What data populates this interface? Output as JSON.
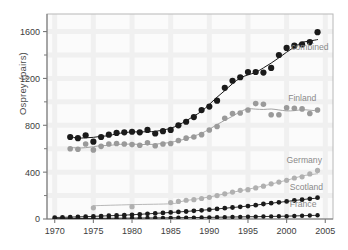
{
  "chart_data": {
    "type": "scatter",
    "title": "",
    "xlabel": "",
    "ylabel": "Osprey (pairs)",
    "xlim": [
      1969,
      2006
    ],
    "ylim": [
      0,
      1750
    ],
    "xticks": [
      1970,
      1975,
      1980,
      1985,
      1990,
      1995,
      2000,
      2005
    ],
    "xtick_labels": [
      "1970",
      "1975",
      "1980",
      "1985",
      "1990",
      "1995",
      "2000",
      "2005"
    ],
    "yticks": [
      0,
      400,
      800,
      1200,
      1600
    ],
    "ytick_labels": [
      "0",
      "400",
      "800",
      "1200",
      "1600"
    ],
    "yminorticks": [
      200,
      600,
      1000,
      1400
    ],
    "grid": "faint",
    "legend_position": "inline-right-of-curve",
    "series": [
      {
        "name": "combined",
        "label": "combined",
        "color": "#1a1a1a",
        "marker": "filled-circle",
        "marker_size": 3.1,
        "fit": "sigmoid-smooth",
        "label_x": 2000.6,
        "label_y": 1445,
        "x": [
          1972,
          1973,
          1974,
          1975,
          1976,
          1977,
          1978,
          1979,
          1980,
          1981,
          1982,
          1983,
          1984,
          1985,
          1986,
          1987,
          1988,
          1989,
          1990,
          1991,
          1992,
          1993,
          1994,
          1995,
          1996,
          1997,
          1998,
          1999,
          2000,
          2001,
          2002,
          2003,
          2004
        ],
        "y": [
          700,
          690,
          715,
          660,
          700,
          720,
          735,
          740,
          745,
          740,
          760,
          730,
          750,
          760,
          800,
          830,
          870,
          930,
          960,
          1010,
          1120,
          1180,
          1210,
          1255,
          1255,
          1250,
          1290,
          1400,
          1460,
          1480,
          1490,
          1510,
          1595
        ]
      },
      {
        "name": "finland",
        "label": "Finland",
        "color": "#9a9a9a",
        "marker": "filled-circle",
        "marker_size": 2.8,
        "fit": "hump-smooth",
        "label_x": 2000.2,
        "label_y": 1010,
        "x": [
          1972,
          1973,
          1974,
          1975,
          1976,
          1977,
          1978,
          1979,
          1980,
          1981,
          1982,
          1983,
          1984,
          1985,
          1986,
          1987,
          1988,
          1989,
          1990,
          1991,
          1992,
          1993,
          1994,
          1995,
          1996,
          1997,
          1998,
          1999,
          2000,
          2001,
          2002,
          2003,
          2004
        ],
        "y": [
          600,
          595,
          640,
          590,
          620,
          640,
          645,
          640,
          635,
          630,
          650,
          625,
          640,
          645,
          670,
          690,
          700,
          720,
          760,
          790,
          860,
          900,
          905,
          930,
          985,
          980,
          890,
          890,
          950,
          945,
          940,
          900,
          930
        ]
      },
      {
        "name": "germany",
        "label": "Germany",
        "color": "#b0b0b0",
        "marker": "filled-circle",
        "marker_size": 2.6,
        "fit": "exponential-smooth",
        "label_x": 2000.0,
        "label_y": 475,
        "x": [
          1975,
          1980,
          1985,
          1986,
          1987,
          1988,
          1989,
          1990,
          1991,
          1992,
          1993,
          1994,
          1995,
          1996,
          1997,
          1998,
          1999,
          2000,
          2001,
          2002,
          2003,
          2004
        ],
        "y": [
          95,
          105,
          140,
          150,
          160,
          165,
          175,
          185,
          200,
          215,
          230,
          245,
          250,
          265,
          280,
          300,
          315,
          330,
          350,
          360,
          385,
          415
        ]
      },
      {
        "name": "scotland",
        "label": "Scotland",
        "color": "#1a1a1a",
        "marker": "filled-circle",
        "marker_size": 2.4,
        "fit": "linear-smooth",
        "label_x": 2000.4,
        "label_y": 250,
        "x": [
          1970,
          1971,
          1972,
          1973,
          1974,
          1975,
          1976,
          1977,
          1978,
          1979,
          1980,
          1981,
          1982,
          1983,
          1984,
          1985,
          1986,
          1987,
          1988,
          1989,
          1990,
          1991,
          1992,
          1993,
          1994,
          1995,
          1996,
          1997,
          1998,
          1999,
          2000,
          2001,
          2002,
          2003,
          2004
        ],
        "y": [
          12,
          14,
          16,
          18,
          20,
          22,
          25,
          28,
          30,
          33,
          36,
          40,
          44,
          48,
          52,
          56,
          60,
          64,
          70,
          74,
          80,
          86,
          92,
          98,
          104,
          110,
          118,
          128,
          135,
          142,
          150,
          158,
          165,
          172,
          182
        ]
      },
      {
        "name": "france",
        "label": "France",
        "color": "#1a1a1a",
        "marker": "filled-circle",
        "marker_size": 2.2,
        "fit": "flat-smooth",
        "label_x": 2000.4,
        "label_y": 105,
        "x": [
          1970,
          1971,
          1972,
          1973,
          1974,
          1975,
          1976,
          1977,
          1978,
          1979,
          1980,
          1981,
          1982,
          1983,
          1984,
          1985,
          1986,
          1987,
          1988,
          1989,
          1990,
          1991,
          1992,
          1993,
          1994,
          1995,
          1996,
          1997,
          1998,
          1999,
          2000,
          2001,
          2002,
          2003,
          2004
        ],
        "y": [
          3,
          3,
          4,
          4,
          5,
          5,
          6,
          6,
          7,
          7,
          8,
          8,
          9,
          9,
          10,
          10,
          11,
          12,
          12,
          13,
          14,
          15,
          16,
          17,
          18,
          19,
          20,
          21,
          22,
          23,
          24,
          26,
          28,
          30,
          32
        ]
      }
    ]
  },
  "colors": {
    "axis": "#7a7a7a",
    "tick_label": "#3d3d3d",
    "plot_bg": "#fbfbfb",
    "grid": "#f0f0f0",
    "legend_text": "#8a8a8a"
  }
}
